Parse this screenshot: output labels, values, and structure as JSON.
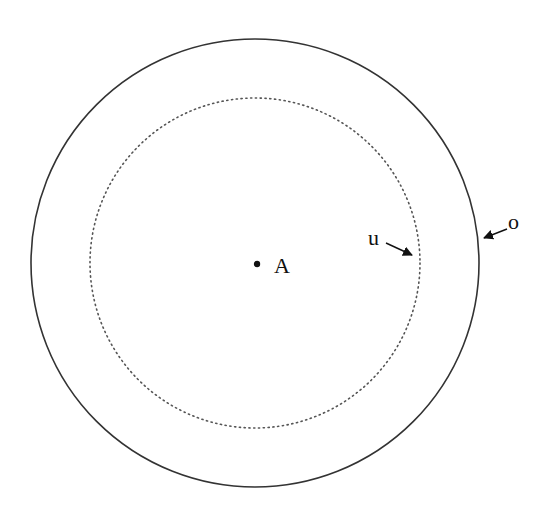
{
  "diagram": {
    "center_label": "A",
    "inner_circle_label": "u",
    "outer_circle_label": "o",
    "colors": {
      "stroke": "#333333",
      "background": "#ffffff"
    }
  }
}
